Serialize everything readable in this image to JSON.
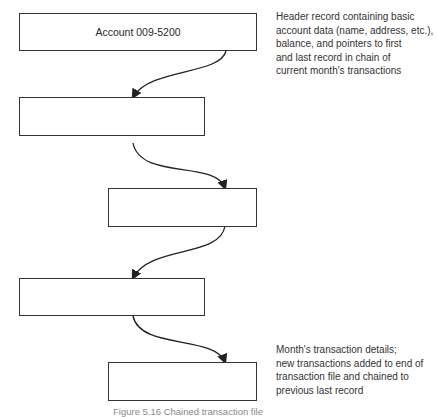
{
  "diagram": {
    "records": [
      {
        "id": "header",
        "label": "Account 009-5200"
      },
      {
        "id": "txn1",
        "label": ""
      },
      {
        "id": "txn2",
        "label": ""
      },
      {
        "id": "txn3",
        "label": ""
      },
      {
        "id": "txn4",
        "label": ""
      }
    ],
    "annotations": {
      "header": "Header record containing basic\naccount data (name, address, etc.),\nbalance, and pointers to first\nand last record in chain of\ncurrent month's transactions",
      "transactions": "Month's transaction details;\nnew transactions added to end of\ntransaction file and chained to\nprevious last record"
    },
    "links": [
      {
        "from": "header",
        "to": "txn1"
      },
      {
        "from": "txn1",
        "to": "txn2"
      },
      {
        "from": "txn2",
        "to": "txn3"
      },
      {
        "from": "txn3",
        "to": "txn4"
      }
    ],
    "caption": "Figure 5.16  Chained transaction file"
  }
}
